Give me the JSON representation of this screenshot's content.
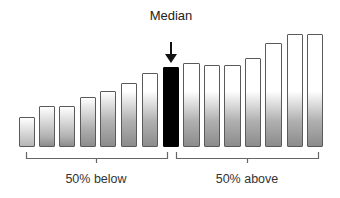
{
  "title": "Median",
  "labels": {
    "below": "50% below",
    "above": "50% above"
  },
  "colors": {
    "median_bar": "#000000",
    "bar_border": "#5a5a5a",
    "bar_gradient_top": "#ffffff",
    "bar_gradient_bottom": "#9a9a9a",
    "bracket": "#666666"
  },
  "bars": [
    {
      "x": 19,
      "w": 16,
      "top": 117
    },
    {
      "x": 39,
      "w": 16,
      "top": 106
    },
    {
      "x": 59,
      "w": 16,
      "top": 106
    },
    {
      "x": 80,
      "w": 16,
      "top": 97
    },
    {
      "x": 100,
      "w": 16,
      "top": 91
    },
    {
      "x": 121,
      "w": 16,
      "top": 83
    },
    {
      "x": 142,
      "w": 16,
      "top": 73
    },
    {
      "x": 163,
      "w": 16,
      "top": 67,
      "median": true
    },
    {
      "x": 183,
      "w": 17,
      "top": 63
    },
    {
      "x": 204,
      "w": 16,
      "top": 65
    },
    {
      "x": 224,
      "w": 17,
      "top": 65
    },
    {
      "x": 245,
      "w": 16,
      "top": 58
    },
    {
      "x": 265,
      "w": 17,
      "top": 43
    },
    {
      "x": 287,
      "w": 16,
      "top": 34
    },
    {
      "x": 307,
      "w": 16,
      "top": 34
    }
  ],
  "baseline": 147,
  "chart_data": {
    "type": "bar",
    "title": "Median",
    "categories": [
      "1",
      "2",
      "3",
      "4",
      "5",
      "6",
      "7",
      "8",
      "9",
      "10",
      "11",
      "12",
      "13",
      "14",
      "15"
    ],
    "values": [
      30,
      41,
      41,
      50,
      56,
      64,
      74,
      80,
      84,
      82,
      82,
      89,
      104,
      113,
      113
    ],
    "highlight_index": 7,
    "annotations": [
      "Median",
      "50% below",
      "50% above"
    ],
    "grid": false
  }
}
